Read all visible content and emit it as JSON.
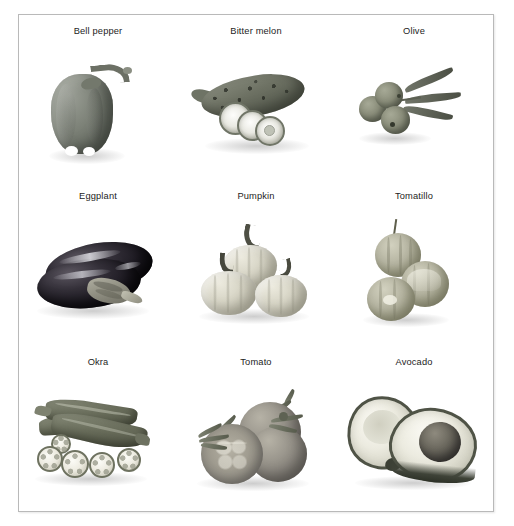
{
  "figure": {
    "border_color": "#b9b9b9",
    "background_color": "#ffffff",
    "columns": 3,
    "rows": 3,
    "cells": [
      {
        "label": "Bell pepper",
        "specimen": "bell-pepper",
        "row": 1,
        "column": 1
      },
      {
        "label": "Bitter melon",
        "specimen": "bitter-melon",
        "row": 1,
        "column": 2
      },
      {
        "label": "Olive",
        "specimen": "olive",
        "row": 1,
        "column": 3
      },
      {
        "label": "Eggplant",
        "specimen": "eggplant",
        "row": 2,
        "column": 1
      },
      {
        "label": "Pumpkin",
        "specimen": "pumpkin",
        "row": 2,
        "column": 2
      },
      {
        "label": "Tomatillo",
        "specimen": "tomatillo",
        "row": 2,
        "column": 3
      },
      {
        "label": "Okra",
        "specimen": "okra",
        "row": 3,
        "column": 1
      },
      {
        "label": "Tomato",
        "specimen": "tomato",
        "row": 3,
        "column": 2
      },
      {
        "label": "Avocado",
        "specimen": "avocado",
        "row": 3,
        "column": 3
      }
    ]
  }
}
